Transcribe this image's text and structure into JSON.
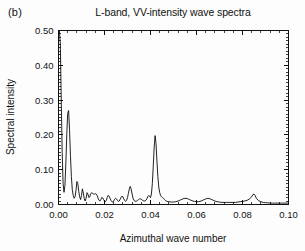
{
  "figure": {
    "panel_label": "(b)",
    "title": "L-band, VV-intensity wave spectra"
  },
  "chart_data": {
    "type": "line",
    "title": "L-band, VV-intensity wave spectra",
    "xlabel": "Azimuthal wave number",
    "ylabel": "Spectral intensity",
    "xlim": [
      0.0,
      0.1
    ],
    "ylim": [
      0.0,
      0.5
    ],
    "xticks": [
      0.0,
      0.02,
      0.04,
      0.06,
      0.08,
      0.1
    ],
    "xtick_labels": [
      "0.00",
      "0.02",
      "0.04",
      "0.06",
      "0.08",
      "0.10"
    ],
    "yticks": [
      0.0,
      0.1,
      0.2,
      0.3,
      0.4,
      0.5
    ],
    "ytick_labels": [
      "0.00",
      "0.10",
      "0.20",
      "0.30",
      "0.40",
      "0.50"
    ],
    "x_minor_tick_count": 4,
    "y_minor_tick_count": 9,
    "grid": false,
    "legend": null,
    "series": [
      {
        "name": "VV-intensity azimuthal spectrum",
        "color": "#0a0a0a",
        "note": "Large DC spike at k=0 clipped by the 0.50 axis limit; secondary peak near k=0.0045 at 0.27; sharp wave peak near k=0.042 at 0.20.",
        "x": [
          0.0,
          0.0004,
          0.0008,
          0.0012,
          0.0016,
          0.002,
          0.0024,
          0.0028,
          0.0032,
          0.0036,
          0.004,
          0.0044,
          0.0048,
          0.0052,
          0.0056,
          0.006,
          0.0064,
          0.0068,
          0.0072,
          0.0076,
          0.008,
          0.0084,
          0.0088,
          0.0092,
          0.0096,
          0.01,
          0.0104,
          0.0108,
          0.0112,
          0.0116,
          0.012,
          0.0124,
          0.0128,
          0.0132,
          0.0136,
          0.014,
          0.0144,
          0.0148,
          0.0152,
          0.0156,
          0.016,
          0.0164,
          0.0168,
          0.0172,
          0.0176,
          0.018,
          0.0184,
          0.0188,
          0.0192,
          0.0196,
          0.02,
          0.0204,
          0.0208,
          0.0212,
          0.0216,
          0.022,
          0.0224,
          0.0228,
          0.0232,
          0.0236,
          0.024,
          0.0244,
          0.0248,
          0.0252,
          0.0256,
          0.026,
          0.0264,
          0.0268,
          0.0272,
          0.0276,
          0.028,
          0.0284,
          0.0288,
          0.0292,
          0.0296,
          0.03,
          0.0304,
          0.0308,
          0.0312,
          0.0316,
          0.032,
          0.0324,
          0.0328,
          0.0332,
          0.0336,
          0.034,
          0.0344,
          0.0348,
          0.0352,
          0.0356,
          0.036,
          0.0364,
          0.0368,
          0.0372,
          0.0376,
          0.038,
          0.0384,
          0.0388,
          0.0392,
          0.0396,
          0.04,
          0.0404,
          0.0408,
          0.0412,
          0.0416,
          0.042,
          0.0424,
          0.0428,
          0.0432,
          0.0436,
          0.044,
          0.0444,
          0.0448,
          0.0452,
          0.0456,
          0.046,
          0.0464,
          0.0468,
          0.0472,
          0.0476,
          0.048,
          0.049,
          0.05,
          0.051,
          0.052,
          0.053,
          0.054,
          0.055,
          0.056,
          0.057,
          0.058,
          0.059,
          0.06,
          0.061,
          0.062,
          0.063,
          0.064,
          0.065,
          0.066,
          0.067,
          0.068,
          0.069,
          0.07,
          0.071,
          0.072,
          0.073,
          0.074,
          0.075,
          0.076,
          0.077,
          0.078,
          0.079,
          0.08,
          0.081,
          0.082,
          0.083,
          0.084,
          0.0845,
          0.085,
          0.0855,
          0.086,
          0.087,
          0.088,
          0.089,
          0.09,
          0.091,
          0.092,
          0.093,
          0.094,
          0.095,
          0.096,
          0.097,
          0.098,
          0.099,
          0.1
        ],
        "y": [
          0.5,
          0.5,
          0.46,
          0.3,
          0.15,
          0.06,
          0.035,
          0.055,
          0.12,
          0.2,
          0.262,
          0.27,
          0.215,
          0.14,
          0.08,
          0.042,
          0.026,
          0.018,
          0.022,
          0.04,
          0.066,
          0.06,
          0.038,
          0.022,
          0.014,
          0.026,
          0.045,
          0.033,
          0.016,
          0.01,
          0.018,
          0.034,
          0.03,
          0.02,
          0.022,
          0.03,
          0.034,
          0.032,
          0.03,
          0.03,
          0.031,
          0.03,
          0.026,
          0.018,
          0.012,
          0.01,
          0.014,
          0.02,
          0.019,
          0.014,
          0.01,
          0.008,
          0.012,
          0.02,
          0.026,
          0.024,
          0.018,
          0.012,
          0.008,
          0.007,
          0.01,
          0.015,
          0.018,
          0.016,
          0.012,
          0.009,
          0.01,
          0.015,
          0.02,
          0.024,
          0.022,
          0.016,
          0.011,
          0.009,
          0.012,
          0.02,
          0.032,
          0.045,
          0.052,
          0.044,
          0.03,
          0.018,
          0.012,
          0.01,
          0.009,
          0.01,
          0.012,
          0.014,
          0.016,
          0.016,
          0.015,
          0.013,
          0.011,
          0.01,
          0.01,
          0.012,
          0.016,
          0.022,
          0.026,
          0.024,
          0.02,
          0.03,
          0.06,
          0.11,
          0.165,
          0.198,
          0.175,
          0.125,
          0.08,
          0.05,
          0.034,
          0.026,
          0.022,
          0.02,
          0.018,
          0.015,
          0.012,
          0.01,
          0.009,
          0.008,
          0.008,
          0.007,
          0.007,
          0.008,
          0.01,
          0.013,
          0.016,
          0.018,
          0.017,
          0.014,
          0.011,
          0.009,
          0.008,
          0.008,
          0.01,
          0.013,
          0.016,
          0.018,
          0.016,
          0.013,
          0.01,
          0.008,
          0.007,
          0.006,
          0.006,
          0.006,
          0.006,
          0.006,
          0.006,
          0.006,
          0.007,
          0.008,
          0.009,
          0.01,
          0.012,
          0.016,
          0.022,
          0.028,
          0.03,
          0.026,
          0.018,
          0.011,
          0.008,
          0.006,
          0.005,
          0.005,
          0.004,
          0.004,
          0.004,
          0.004,
          0.004,
          0.004,
          0.004,
          0.004,
          0.004
        ]
      }
    ]
  }
}
